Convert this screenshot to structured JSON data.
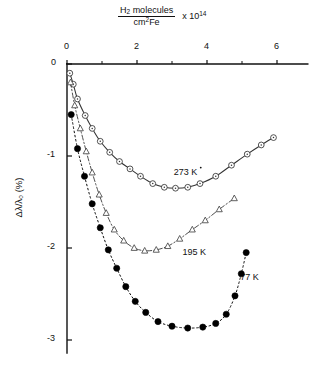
{
  "figure": {
    "background": "#ffffff",
    "ink": "#111111"
  },
  "axes": {
    "top_axis": {
      "label_numerator": "H2 molecules",
      "label_denominator": "cm2Fe",
      "label_multiplier": "x 10",
      "label_exponent": "14",
      "label_plain": "H2 molecules / cm2Fe  x 10^14",
      "ticks": [
        "0",
        "2",
        "4",
        "6"
      ],
      "tick_values": [
        0,
        2,
        4,
        6
      ],
      "range": [
        0,
        6.9
      ],
      "position": "top"
    },
    "y_axis": {
      "label": "Δλ/λ₀ (%)",
      "ticks": [
        "0",
        "-1",
        "-2",
        "-3"
      ],
      "tick_values": [
        0,
        -1,
        -2,
        -3
      ],
      "range": [
        -3.15,
        0.05
      ],
      "position": "left"
    },
    "origin_label": "0"
  },
  "chart_data": {
    "type": "scatter",
    "title": "",
    "subtitle": "",
    "xlabel": "H2 molecules / cm2Fe  x 10^14",
    "ylabel": "Δλ/λ₀ (%)",
    "xlim": [
      0,
      6.9
    ],
    "ylim": [
      -3.15,
      0.05
    ],
    "xticks": [
      0,
      2,
      4,
      6
    ],
    "yticks": [
      0,
      -1,
      -2,
      -3
    ],
    "grid": false,
    "legend": "inline-annotations",
    "series": [
      {
        "name": "273 K",
        "label": "273 K",
        "marker": "open-circle",
        "line": "solid",
        "color": "#333333",
        "label_x": 3.05,
        "label_y": -1.18,
        "points": [
          {
            "x": 0.08,
            "y": -0.1
          },
          {
            "x": 0.18,
            "y": -0.22
          },
          {
            "x": 0.3,
            "y": -0.38
          },
          {
            "x": 0.52,
            "y": -0.56
          },
          {
            "x": 0.72,
            "y": -0.7
          },
          {
            "x": 0.95,
            "y": -0.84
          },
          {
            "x": 1.22,
            "y": -0.96
          },
          {
            "x": 1.5,
            "y": -1.06
          },
          {
            "x": 1.8,
            "y": -1.14
          },
          {
            "x": 2.1,
            "y": -1.22
          },
          {
            "x": 2.45,
            "y": -1.3
          },
          {
            "x": 2.78,
            "y": -1.34
          },
          {
            "x": 3.1,
            "y": -1.35
          },
          {
            "x": 3.45,
            "y": -1.34
          },
          {
            "x": 3.8,
            "y": -1.3
          },
          {
            "x": 4.25,
            "y": -1.22
          },
          {
            "x": 4.7,
            "y": -1.1
          },
          {
            "x": 5.15,
            "y": -0.98
          },
          {
            "x": 5.55,
            "y": -0.88
          },
          {
            "x": 5.9,
            "y": -0.8
          }
        ]
      },
      {
        "name": "195 K",
        "label": "195 K",
        "marker": "open-triangle",
        "line": "dash-dot",
        "color": "#444444",
        "label_x": 3.3,
        "label_y": -2.05,
        "points": [
          {
            "x": 0.1,
            "y": -0.2
          },
          {
            "x": 0.22,
            "y": -0.45
          },
          {
            "x": 0.38,
            "y": -0.7
          },
          {
            "x": 0.55,
            "y": -0.95
          },
          {
            "x": 0.72,
            "y": -1.18
          },
          {
            "x": 0.92,
            "y": -1.42
          },
          {
            "x": 1.12,
            "y": -1.62
          },
          {
            "x": 1.35,
            "y": -1.8
          },
          {
            "x": 1.62,
            "y": -1.92
          },
          {
            "x": 1.92,
            "y": -2.0
          },
          {
            "x": 2.22,
            "y": -2.03
          },
          {
            "x": 2.55,
            "y": -2.02
          },
          {
            "x": 2.88,
            "y": -1.98
          },
          {
            "x": 3.22,
            "y": -1.9
          },
          {
            "x": 3.58,
            "y": -1.8
          },
          {
            "x": 3.95,
            "y": -1.7
          },
          {
            "x": 4.35,
            "y": -1.58
          },
          {
            "x": 4.78,
            "y": -1.46
          }
        ]
      },
      {
        "name": "77 K",
        "label": "77 K",
        "marker": "filled-circle",
        "line": "dotted",
        "color": "#000000",
        "label_x": 4.95,
        "label_y": -2.33,
        "points": [
          {
            "x": 0.12,
            "y": -0.55
          },
          {
            "x": 0.3,
            "y": -0.92
          },
          {
            "x": 0.5,
            "y": -1.22
          },
          {
            "x": 0.72,
            "y": -1.52
          },
          {
            "x": 0.95,
            "y": -1.78
          },
          {
            "x": 1.18,
            "y": -2.02
          },
          {
            "x": 1.42,
            "y": -2.22
          },
          {
            "x": 1.68,
            "y": -2.42
          },
          {
            "x": 1.95,
            "y": -2.58
          },
          {
            "x": 2.25,
            "y": -2.7
          },
          {
            "x": 2.6,
            "y": -2.8
          },
          {
            "x": 3.0,
            "y": -2.85
          },
          {
            "x": 3.45,
            "y": -2.87
          },
          {
            "x": 3.88,
            "y": -2.86
          },
          {
            "x": 4.25,
            "y": -2.82
          },
          {
            "x": 4.55,
            "y": -2.72
          },
          {
            "x": 4.8,
            "y": -2.52
          },
          {
            "x": 4.98,
            "y": -2.28
          },
          {
            "x": 5.12,
            "y": -2.05
          }
        ]
      }
    ]
  }
}
